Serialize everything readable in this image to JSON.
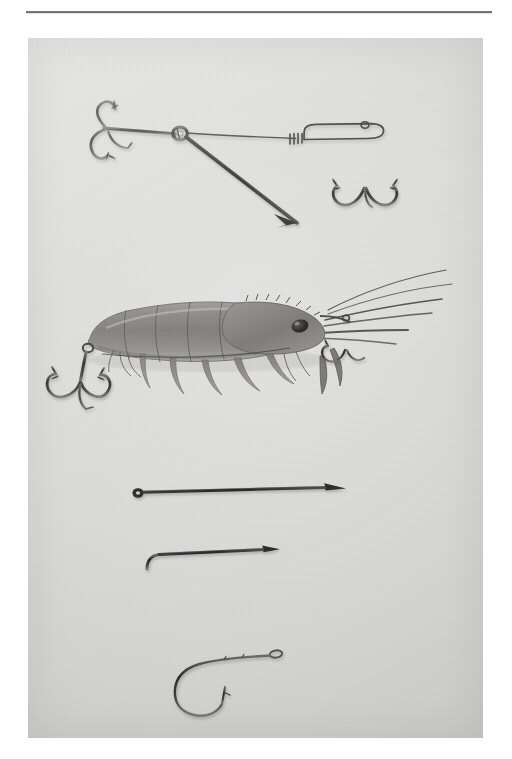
{
  "page": {
    "kind": "scanned-book-page",
    "background_color": "#fefefe",
    "rule": {
      "color": "#5d5d5d",
      "x": 26,
      "y": 11,
      "width": 466,
      "height": 2
    }
  },
  "plate": {
    "name": "fishing-tackle-photographic-plate",
    "description": "Monochrome photographic plate showing fishing tackle laid out on a plain light-grey card: a wire treble-hook rig, a whole shrimp rigged as bait, two baiting needles and a single long-shank hook.",
    "x": 28,
    "y": 38,
    "width": 455,
    "height": 700,
    "background_color": "#dcdcdb",
    "ink_color": "#2b2b2b",
    "highlight_color": "#f2f2f1",
    "subjects": [
      {
        "id": "wire-rig",
        "label": "Two-hook wire bait rig",
        "order": 1,
        "parts": [
          "front treble hook",
          "wire eye / twisted loop",
          "long straight wire shank with pointed end",
          "elongated wire loop frame",
          "rear treble hook"
        ]
      },
      {
        "id": "shrimp-bait",
        "label": "Whole shrimp mounted on the rig",
        "order": 2,
        "parts": [
          "segmented abdomen",
          "carapace and rostrum",
          "eye",
          "long antennae",
          "pereiopods (walking legs)",
          "tail fan",
          "tail treble hook",
          "head treble hook"
        ]
      },
      {
        "id": "baiting-needle-long",
        "label": "Long baiting needle with ring eye",
        "order": 3
      },
      {
        "id": "baiting-needle-short",
        "label": "Short baiting needle with bent hook end",
        "order": 4
      },
      {
        "id": "single-hook",
        "label": "Single long-shank hook with turned-down eye",
        "order": 5
      }
    ]
  }
}
